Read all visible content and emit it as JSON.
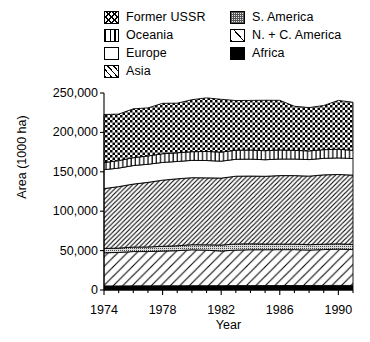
{
  "chart_data": {
    "type": "area",
    "stacked": true,
    "title": "",
    "xlabel": "Year",
    "ylabel": "Area (1000 ha)",
    "xlim": [
      1974,
      1991
    ],
    "ylim": [
      0,
      250000
    ],
    "yticks": [
      "0",
      "50,000",
      "100,000",
      "150,000",
      "200,000",
      "250,000"
    ],
    "ytick_values": [
      0,
      50000,
      100000,
      150000,
      200000,
      250000
    ],
    "xticks": [
      "1974",
      "1978",
      "1982",
      "1986",
      "1990"
    ],
    "xtick_values": [
      1974,
      1978,
      1982,
      1986,
      1990
    ],
    "grid": false,
    "legend_position": "above-plot",
    "x": [
      1974,
      1975,
      1976,
      1977,
      1978,
      1979,
      1980,
      1981,
      1982,
      1983,
      1984,
      1985,
      1986,
      1987,
      1988,
      1989,
      1990,
      1991
    ],
    "series": [
      {
        "name": "Africa",
        "pattern": "solid-black",
        "values": [
          5200,
          5200,
          5300,
          5300,
          5400,
          5400,
          5500,
          5500,
          5500,
          5600,
          5600,
          5600,
          5700,
          5700,
          5700,
          5800,
          5800,
          5800
        ]
      },
      {
        "name": "N. + C. America",
        "pattern": "sparse-diagonal",
        "values": [
          42000,
          42500,
          43500,
          43500,
          44000,
          44500,
          45500,
          45000,
          44000,
          45000,
          45500,
          45500,
          45500,
          45500,
          45000,
          45500,
          46000,
          45500
        ]
      },
      {
        "name": "S. America",
        "pattern": "stipple-gray",
        "values": [
          5500,
          5500,
          5600,
          5800,
          6000,
          6200,
          6500,
          6800,
          7500,
          7800,
          7500,
          7200,
          7000,
          7000,
          6800,
          6800,
          6800,
          6500
        ]
      },
      {
        "name": "Asia",
        "pattern": "dense-diagonal",
        "values": [
          76000,
          78000,
          80000,
          82000,
          84000,
          85000,
          85000,
          85000,
          85000,
          86000,
          86000,
          86000,
          87000,
          87000,
          87000,
          88000,
          88000,
          88000
        ]
      },
      {
        "name": "Europe",
        "pattern": "white",
        "values": [
          24000,
          23500,
          23500,
          23000,
          22500,
          22000,
          22000,
          22000,
          21500,
          21500,
          21500,
          21000,
          21000,
          21000,
          21000,
          21000,
          21000,
          21000
        ]
      },
      {
        "name": "Oceania",
        "pattern": "vertical-lines",
        "values": [
          9000,
          9500,
          10000,
          10500,
          11000,
          11000,
          11000,
          11500,
          11500,
          11500,
          11500,
          11500,
          11500,
          11000,
          11000,
          11000,
          11000,
          10500
        ]
      },
      {
        "name": "Former USSR",
        "pattern": "checkered",
        "values": [
          61000,
          59000,
          62000,
          61000,
          64000,
          63000,
          66000,
          68000,
          67000,
          63000,
          63000,
          64000,
          63000,
          56000,
          55000,
          56000,
          62000,
          61000
        ]
      }
    ],
    "totals": [
      222700,
      223200,
      229900,
      231100,
      236900,
      237100,
      241500,
      243800,
      242000,
      240400,
      240600,
      240800,
      240700,
      233200,
      231500,
      234100,
      240600,
      238300
    ]
  },
  "legend": {
    "column1": [
      {
        "label": "Former USSR",
        "swatch": "p-ussr",
        "icon": "checkered-swatch"
      },
      {
        "label": "Oceania",
        "swatch": "p-oceania",
        "icon": "vertical-lines-swatch"
      },
      {
        "label": "Europe",
        "swatch": "p-europe",
        "icon": "blank-swatch"
      },
      {
        "label": "Asia",
        "swatch": "p-asia",
        "icon": "dense-diagonal-swatch"
      }
    ],
    "column2": [
      {
        "label": "S. America",
        "swatch": "p-samerica",
        "icon": "stipple-swatch"
      },
      {
        "label": "N. + C. America",
        "swatch": "p-ncamerica",
        "icon": "sparse-diagonal-swatch"
      },
      {
        "label": "Africa",
        "swatch": "p-africa",
        "icon": "solid-black-swatch"
      }
    ]
  },
  "colors": {
    "axis": "#000000",
    "background": "#ffffff",
    "stipple_fill": "#e6e6e6"
  }
}
